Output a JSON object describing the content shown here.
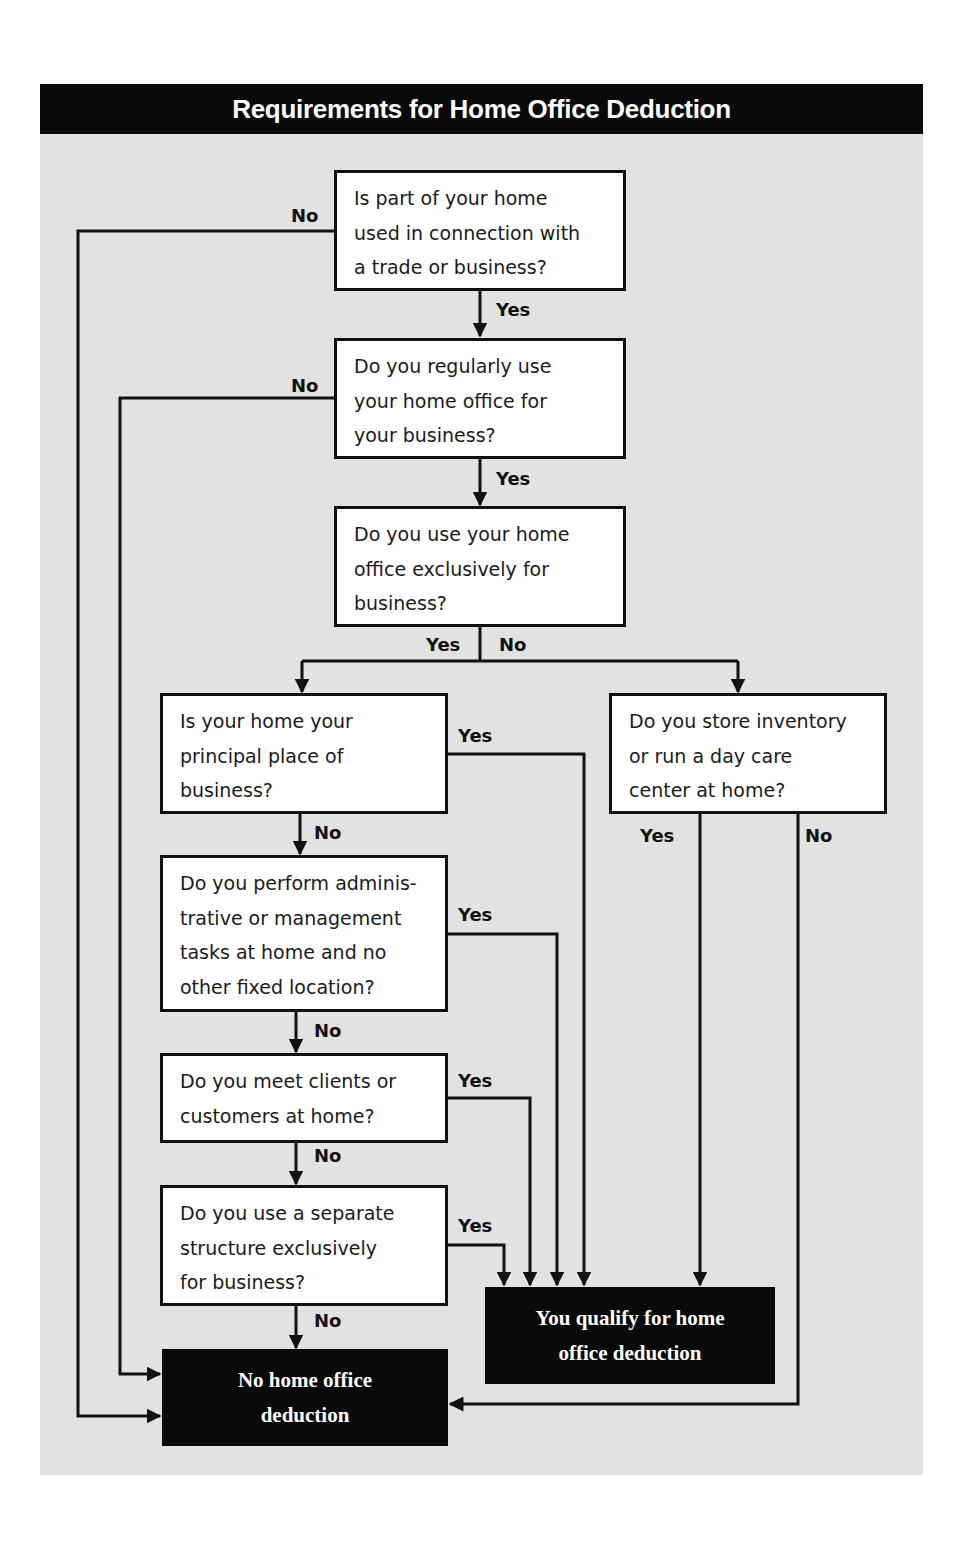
{
  "title": "Requirements for Home Office Deduction",
  "colors": {
    "header_bg": "#0a0a0a",
    "panel_bg": "#e2e2e2",
    "box_bg": "#ffffff",
    "line": "#111111",
    "result_bg": "#0a0a0a"
  },
  "questions": [
    {
      "id": "q1",
      "text": "Is part of your home\nused in connection with\na trade or business?"
    },
    {
      "id": "q2",
      "text": "Do you regularly use\nyour home office for\nyour business?"
    },
    {
      "id": "q3",
      "text": "Do you use your home\noffice exclusively for\nbusiness?"
    },
    {
      "id": "q4",
      "text": "Is your home your\nprincipal place of\nbusiness?"
    },
    {
      "id": "q5",
      "text": "Do you store inventory\nor run a day care\ncenter at home?"
    },
    {
      "id": "q6",
      "text": "Do you perform adminis-\ntrative or management\ntasks at home and no\nother fixed location?"
    },
    {
      "id": "q7",
      "text": "Do you meet clients or\ncustomers at home?"
    },
    {
      "id": "q8",
      "text": "Do you use a separate\nstructure exclusively\nfor business?"
    }
  ],
  "results": {
    "qualify": "You qualify for home\noffice deduction",
    "no_deduction": "No home office\ndeduction"
  },
  "labels": {
    "q1_no": "No",
    "q1_yes": "Yes",
    "q2_no": "No",
    "q2_yes": "Yes",
    "q3_yes": "Yes",
    "q3_no": "No",
    "q4_yes": "Yes",
    "q4_no": "No",
    "q5_yes": "Yes",
    "q5_no": "No",
    "q6_yes": "Yes",
    "q6_no": "No",
    "q7_yes": "Yes",
    "q7_no": "No",
    "q8_yes": "Yes",
    "q8_no": "No"
  }
}
